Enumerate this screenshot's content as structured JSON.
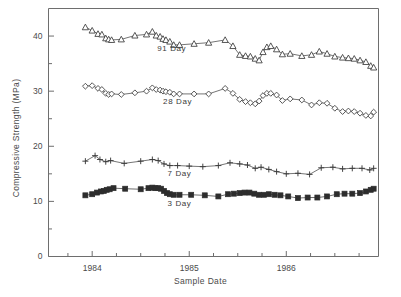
{
  "chart_data": {
    "type": "line",
    "title": "",
    "xlabel": "Sample Date",
    "ylabel": "Compressive Strength  (MPa)",
    "xlim": [
      1983.55,
      1986.95
    ],
    "ylim": [
      0,
      45
    ],
    "grid": false,
    "legend_position": "inline-annotation",
    "y_ticks_major": [
      0,
      10,
      20,
      30,
      40
    ],
    "y_ticks_minor": [
      5,
      15,
      25,
      35
    ],
    "y_tick_labels": [
      "0",
      "10",
      "20",
      "30",
      "40"
    ],
    "x_ticks_major": [
      1984,
      1985,
      1986
    ],
    "x_tick_labels": [
      "1984",
      "1985",
      "1986"
    ],
    "x_ticks_minor": [
      1983.75,
      1984.25,
      1984.5,
      1984.75,
      1985.25,
      1985.5,
      1985.75,
      1986.25,
      1986.5,
      1986.75
    ],
    "series": [
      {
        "name": "91 Day",
        "marker": "open-triangle",
        "color": "#3a3a3a",
        "label_x": 1984.82,
        "label_y": 37.6,
        "x": [
          1983.93,
          1984.0,
          1984.06,
          1984.1,
          1984.14,
          1984.17,
          1984.2,
          1984.3,
          1984.44,
          1984.56,
          1984.62,
          1984.66,
          1984.7,
          1984.73,
          1984.76,
          1984.8,
          1984.84,
          1984.9,
          1985.05,
          1985.2,
          1985.37,
          1985.45,
          1985.52,
          1985.58,
          1985.63,
          1985.68,
          1985.72,
          1985.76,
          1985.8,
          1985.84,
          1985.9,
          1985.96,
          1986.04,
          1986.16,
          1986.26,
          1986.34,
          1986.42,
          1986.5,
          1986.58,
          1986.64,
          1986.7,
          1986.76,
          1986.82,
          1986.87,
          1986.9
        ],
        "y": [
          41.6,
          41.0,
          40.4,
          40.3,
          39.6,
          39.4,
          39.3,
          39.4,
          40.1,
          40.3,
          40.8,
          40.1,
          39.9,
          39.5,
          39.3,
          39.0,
          38.4,
          38.4,
          38.6,
          38.8,
          39.3,
          38.2,
          36.6,
          36.4,
          36.3,
          35.9,
          35.6,
          37.1,
          38.0,
          38.2,
          37.6,
          36.7,
          36.8,
          36.4,
          36.6,
          37.2,
          36.8,
          36.3,
          36.1,
          36.0,
          35.9,
          35.6,
          35.3,
          34.6,
          34.3
        ]
      },
      {
        "name": "28 Day",
        "marker": "open-diamond",
        "color": "#3a3a3a",
        "label_x": 1984.88,
        "label_y": 28.1,
        "x": [
          1983.93,
          1984.0,
          1984.06,
          1984.1,
          1984.14,
          1984.17,
          1984.2,
          1984.3,
          1984.44,
          1984.56,
          1984.62,
          1984.66,
          1984.7,
          1984.73,
          1984.76,
          1984.8,
          1984.84,
          1984.9,
          1985.05,
          1985.2,
          1985.37,
          1985.45,
          1985.52,
          1985.58,
          1985.63,
          1985.68,
          1985.72,
          1985.76,
          1985.8,
          1985.84,
          1985.9,
          1985.96,
          1986.04,
          1986.16,
          1986.26,
          1986.34,
          1986.42,
          1986.5,
          1986.58,
          1986.64,
          1986.7,
          1986.76,
          1986.82,
          1986.87,
          1986.9
        ],
        "y": [
          30.9,
          31.0,
          30.5,
          30.3,
          29.6,
          29.4,
          29.5,
          29.4,
          29.7,
          30.0,
          30.6,
          30.3,
          30.2,
          30.0,
          29.9,
          29.8,
          29.5,
          29.5,
          29.5,
          29.5,
          30.5,
          29.6,
          28.5,
          28.1,
          27.9,
          27.7,
          28.2,
          29.2,
          29.6,
          29.6,
          29.3,
          28.3,
          28.6,
          28.4,
          27.5,
          27.9,
          27.8,
          26.9,
          26.3,
          26.4,
          26.3,
          26.0,
          25.6,
          25.5,
          26.2
        ]
      },
      {
        "name": "7 Day",
        "marker": "plus",
        "color": "#3a3a3a",
        "label_x": 1984.9,
        "label_y": 14.9,
        "x": [
          1983.93,
          1984.03,
          1984.08,
          1984.14,
          1984.19,
          1984.33,
          1984.5,
          1984.62,
          1984.68,
          1984.74,
          1984.8,
          1984.88,
          1985.0,
          1985.14,
          1985.3,
          1985.42,
          1985.52,
          1985.6,
          1985.68,
          1985.74,
          1985.82,
          1985.9,
          1986.0,
          1986.12,
          1986.24,
          1986.36,
          1986.48,
          1986.58,
          1986.68,
          1986.78,
          1986.86,
          1986.9
        ],
        "y": [
          17.3,
          18.3,
          17.6,
          17.2,
          17.4,
          16.9,
          17.3,
          17.6,
          17.4,
          16.8,
          16.5,
          16.5,
          16.4,
          16.3,
          16.5,
          17.0,
          16.8,
          16.6,
          16.0,
          16.2,
          15.8,
          15.4,
          15.0,
          15.1,
          14.9,
          16.1,
          16.2,
          15.9,
          16.0,
          16.0,
          15.7,
          16.0
        ]
      },
      {
        "name": "3 Day",
        "marker": "filled-square",
        "color": "#2d2d2d",
        "label_x": 1984.9,
        "label_y": 9.5,
        "x": [
          1983.93,
          1984.0,
          1984.05,
          1984.09,
          1984.12,
          1984.15,
          1984.18,
          1984.22,
          1984.34,
          1984.5,
          1984.58,
          1984.62,
          1984.65,
          1984.68,
          1984.71,
          1984.74,
          1984.77,
          1984.8,
          1984.84,
          1984.9,
          1985.02,
          1985.16,
          1985.3,
          1985.4,
          1985.46,
          1985.52,
          1985.57,
          1985.62,
          1985.67,
          1985.72,
          1985.77,
          1985.82,
          1985.88,
          1985.94,
          1986.02,
          1986.12,
          1986.22,
          1986.32,
          1986.42,
          1986.52,
          1986.6,
          1986.68,
          1986.76,
          1986.82,
          1986.87,
          1986.9
        ],
        "y": [
          11.1,
          11.3,
          11.6,
          11.8,
          11.9,
          12.1,
          12.2,
          12.4,
          12.3,
          12.2,
          12.4,
          12.5,
          12.4,
          12.4,
          12.3,
          11.9,
          11.5,
          11.3,
          11.2,
          11.2,
          11.2,
          11.1,
          10.9,
          11.3,
          11.4,
          11.5,
          11.6,
          11.6,
          11.4,
          11.2,
          11.2,
          11.3,
          11.2,
          11.1,
          10.9,
          10.6,
          10.7,
          10.7,
          10.9,
          11.3,
          11.4,
          11.4,
          11.5,
          11.8,
          12.1,
          12.3
        ]
      }
    ]
  }
}
